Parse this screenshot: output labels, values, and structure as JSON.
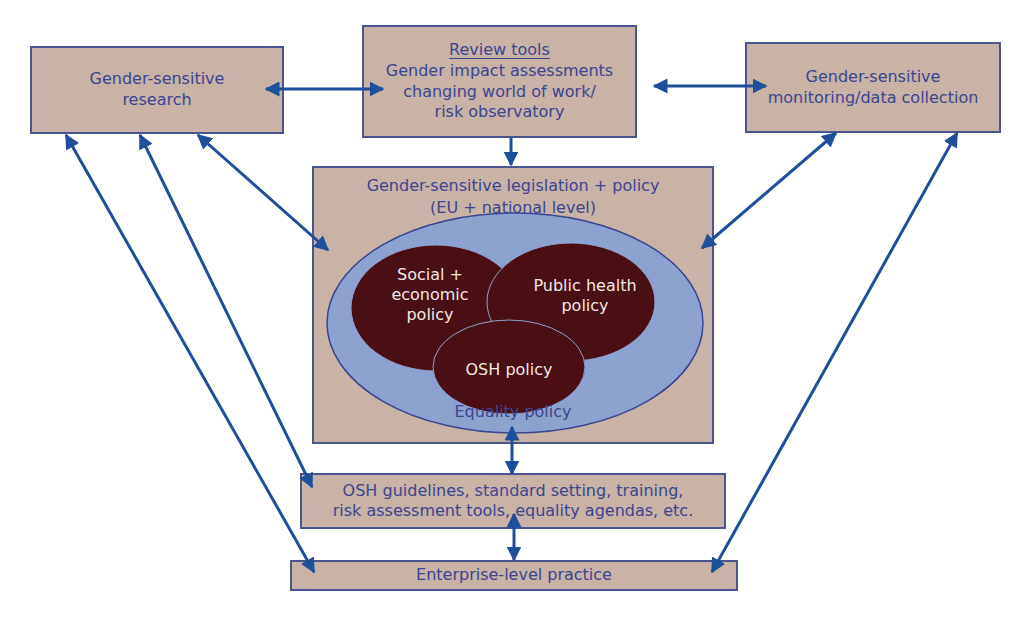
{
  "diagram": {
    "nodes": {
      "research": {
        "lines": [
          "Gender-sensitive",
          "research"
        ]
      },
      "review_tools": {
        "heading": "Review tools",
        "lines": [
          "Gender impact assessments",
          "changing world of work/",
          "risk observatory"
        ]
      },
      "monitoring": {
        "lines": [
          "Gender-sensitive",
          "monitoring/data collection"
        ]
      },
      "legislation": {
        "lines": [
          "Gender-sensitive legislation + policy",
          "(EU + national level)"
        ]
      },
      "equality_policy": {
        "label": "Equality policy"
      },
      "social_economic": {
        "lines": [
          "Social +",
          "economic",
          "policy"
        ]
      },
      "public_health": {
        "lines": [
          "Public health",
          "policy"
        ]
      },
      "osh_policy": {
        "label": "OSH policy"
      },
      "guidelines": {
        "lines": [
          "OSH guidelines, standard setting, training,",
          "risk assessment tools, equality agendas, etc."
        ]
      },
      "enterprise": {
        "label": "Enterprise-level practice"
      }
    },
    "edges": [
      {
        "from": "research",
        "to": "review_tools",
        "type": "bidirectional"
      },
      {
        "from": "review_tools",
        "to": "monitoring",
        "type": "bidirectional"
      },
      {
        "from": "review_tools",
        "to": "legislation",
        "type": "directed"
      },
      {
        "from": "research",
        "to": "legislation",
        "type": "bidirectional"
      },
      {
        "from": "monitoring",
        "to": "legislation",
        "type": "bidirectional"
      },
      {
        "from": "legislation",
        "to": "guidelines",
        "type": "bidirectional"
      },
      {
        "from": "guidelines",
        "to": "enterprise",
        "type": "bidirectional"
      },
      {
        "from": "research",
        "to": "guidelines",
        "type": "bidirectional"
      },
      {
        "from": "research",
        "to": "enterprise",
        "type": "bidirectional"
      },
      {
        "from": "monitoring",
        "to": "enterprise",
        "type": "bidirectional"
      }
    ],
    "colors": {
      "box_fill": "#c9b2a6",
      "box_border": "#4a5590",
      "arrow": "#1f4e9a",
      "text": "#3a4690",
      "equality_ellipse": "#8ea2cf",
      "policy_ellipse": "#4a0f14",
      "policy_text": "#f1e6e2"
    }
  }
}
